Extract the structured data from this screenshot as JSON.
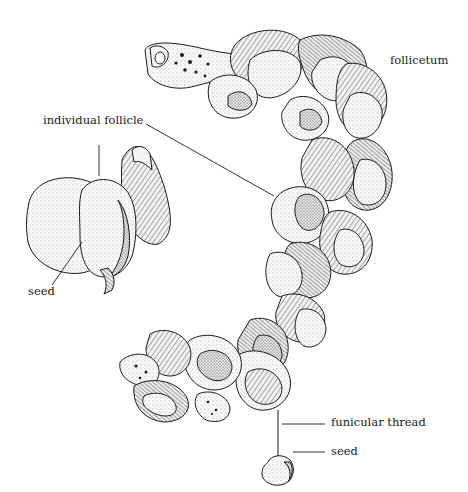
{
  "figure": {
    "labels": {
      "follicetum": "follicetum",
      "individual_follicle": "individual follicle",
      "seed_left": "seed",
      "funicular_thread": "funicular thread",
      "seed_bottom": "seed"
    },
    "colors": {
      "ink": "#1a1a1a",
      "background": "#ffffff",
      "fill_light": "#f4f4f4",
      "fill_mid": "#d9d9d9",
      "fill_dark": "#8a8a8a"
    }
  }
}
